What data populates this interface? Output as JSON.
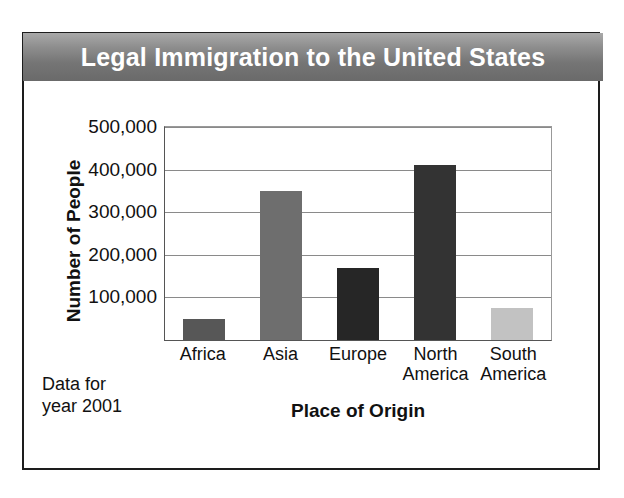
{
  "figure": {
    "title": "Legal Immigration to the United States",
    "note_line1": "Data for",
    "note_line2": "year 2001"
  },
  "colors": {
    "title_band": "#7a7a7a",
    "frame": "#1d1d1d",
    "gridline": "#8a8a8a",
    "text": "#111111"
  },
  "chart_data": {
    "type": "bar",
    "title": "Legal Immigration to the United States",
    "xlabel": "Place of Origin",
    "ylabel": "Number of People",
    "categories": [
      "Africa",
      "Asia",
      "Europe",
      "North America",
      "South America"
    ],
    "category_lines": [
      [
        "Africa"
      ],
      [
        "Asia"
      ],
      [
        "Europe"
      ],
      [
        "North",
        "America"
      ],
      [
        "South",
        "America"
      ]
    ],
    "values": [
      50000,
      350000,
      170000,
      410000,
      75000
    ],
    "bar_colors": [
      "#575757",
      "#6e6e6e",
      "#262626",
      "#333333",
      "#c2c2c2"
    ],
    "ylim": [
      0,
      500000
    ],
    "yticks": [
      100000,
      200000,
      300000,
      400000,
      500000
    ],
    "ytick_labels": [
      "100,000",
      "200,000",
      "300,000",
      "400,000",
      "500,000"
    ],
    "grid": true,
    "legend": "none",
    "annotation": "Data for year 2001"
  }
}
